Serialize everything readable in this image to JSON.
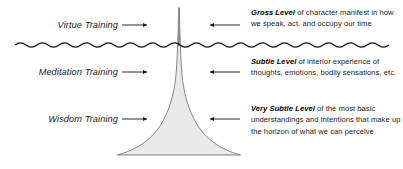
{
  "diagram": {
    "background_color": "#ffffff",
    "funnel": {
      "fill_color": "#e8e8e8",
      "stroke_color": "#4a4a4a",
      "spike_color": "#8a8a8a",
      "description": "funnel-shaped spike narrowing upward through the wavy surface line"
    },
    "surface_line": {
      "name": "wavy-surface-line",
      "color": "#111111",
      "description": "horizontal wavy line marking the threshold between gross and subtle levels"
    },
    "left_labels": [
      {
        "text": "Virtue Training",
        "arrow": "arrow-right-icon"
      },
      {
        "text": "Meditation Training",
        "arrow": "arrow-right-icon"
      },
      {
        "text": "Wisdom Training",
        "arrow": "arrow-right-icon"
      }
    ],
    "right_blocks": [
      {
        "lead": "Gross Level",
        "body": " of character manifest in how we speak, act, and occupy our time",
        "arrow": "arrow-left-icon"
      },
      {
        "lead": "Subtle Level",
        "body": " of interior experience of thoughts, emotions, bodily sensations, etc.",
        "arrow": "arrow-left-icon"
      },
      {
        "lead": "Very Subtle Level",
        "body": " of the most basic understandings and intentions that make up the horizon of what we can perceive",
        "arrow": "arrow-left-icon"
      }
    ]
  }
}
